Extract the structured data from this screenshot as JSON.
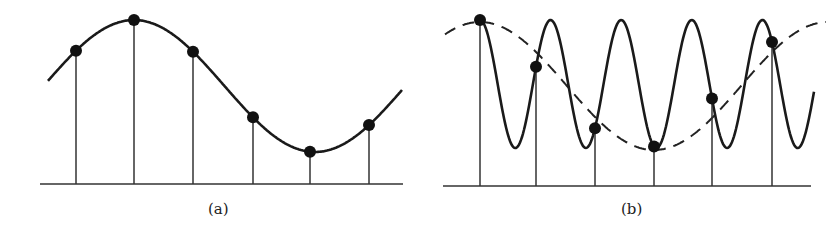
{
  "panels": [
    {
      "id": "a",
      "label": "(a)",
      "description": "Slowly varying sinusoid sampled at adequate rate",
      "curve": {
        "style": "solid",
        "x_start": 48,
        "x_end": 402,
        "center_y": 86,
        "amplitude": 66,
        "period": 362,
        "peak_x": 134
      },
      "baseline": {
        "y": 184,
        "x1": 40,
        "x2": 403
      },
      "samples_x": [
        76,
        134,
        193,
        253,
        310,
        369
      ]
    },
    {
      "id": "b",
      "label": "(b)",
      "description": "High-frequency sinusoid undersampled, aliasing to low-frequency dashed sinusoid",
      "curve": {
        "style": "solid",
        "x_start": 480,
        "x_end": 814,
        "center_y": 84,
        "amplitude": 64,
        "period": 70.6,
        "peak_x": 480
      },
      "alias_curve": {
        "style": "dashed",
        "x_start": 445,
        "x_end": 826,
        "center_y": 86,
        "amplitude": 64,
        "period": 348,
        "peak_x": 480
      },
      "baseline": {
        "y": 186,
        "x1": 443,
        "x2": 811
      },
      "samples_x": [
        480,
        536,
        595,
        654,
        712,
        772
      ]
    }
  ]
}
